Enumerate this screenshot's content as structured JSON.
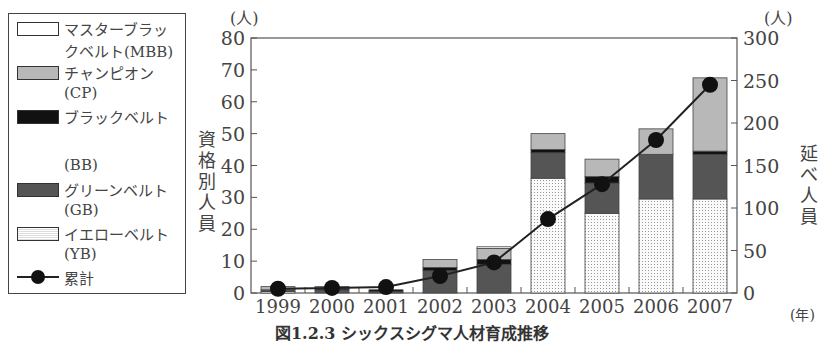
{
  "chart_data": {
    "type": "bar",
    "stacked": true,
    "categories": [
      "1999",
      "2000",
      "2001",
      "2002",
      "2003",
      "2004",
      "2005",
      "2006",
      "2007"
    ],
    "series": [
      {
        "name": "イエローベルト(YB)",
        "key": "YB",
        "axis": "left",
        "values": [
          0.5,
          0,
          0,
          0,
          0,
          36,
          25,
          29.5,
          29.5
        ]
      },
      {
        "name": "グリーンベルト(GB)",
        "key": "GB",
        "axis": "left",
        "values": [
          0.5,
          1,
          0.5,
          7,
          9,
          8,
          9.5,
          14,
          14
        ]
      },
      {
        "name": "ブラックベルト(BB)",
        "key": "BB",
        "axis": "left",
        "values": [
          0,
          0.5,
          0.5,
          1,
          1.5,
          1,
          2,
          0,
          1
        ]
      },
      {
        "name": "チャンピオン(CP)",
        "key": "CP",
        "axis": "left",
        "values": [
          1,
          0.5,
          0,
          2.5,
          3.5,
          5,
          5.5,
          8,
          23
        ]
      },
      {
        "name": "マスターブラックベルト(MBB)",
        "key": "MBB",
        "axis": "left",
        "values": [
          0,
          0,
          0,
          0,
          0.5,
          0,
          0,
          0,
          0
        ]
      },
      {
        "name": "累計",
        "key": "cumulative",
        "type": "line",
        "axis": "right",
        "values": [
          5,
          6,
          7,
          20,
          36,
          87,
          128,
          180,
          245
        ]
      }
    ],
    "title": "図1.2.3 シックスシグマ人材育成推移",
    "xlabel": "(年)",
    "ylabel": "資格別人員",
    "ylabel_unit": "(人)",
    "y2label": "延べ人員",
    "y2label_unit": "(人)",
    "ylim": [
      0,
      80
    ],
    "yticks": [
      0,
      10,
      20,
      30,
      40,
      50,
      60,
      70,
      80
    ],
    "y2lim": [
      0,
      300
    ],
    "y2ticks": [
      0,
      50,
      100,
      150,
      200,
      250,
      300
    ],
    "grid": false,
    "legend_position": "left"
  },
  "legend": {
    "items": [
      {
        "line1": "マスターブラッ",
        "line2": "クベルト(MBB)"
      },
      {
        "line1": "チャンピオン",
        "line2": "(CP)"
      },
      {
        "line1": "ブラックベルト",
        "line2": "(BB)"
      },
      {
        "line1": "グリーンベルト",
        "line2": "(GB)"
      },
      {
        "line1": "イエローベルト",
        "line2": "(YB)"
      },
      {
        "line1": "累計"
      }
    ]
  },
  "axes": {
    "left_unit": "(人)",
    "right_unit": "(人)",
    "x_unit": "(年)",
    "left_title": [
      "資",
      "格",
      "別",
      "人",
      "員"
    ],
    "right_title": [
      "延",
      "べ",
      "人",
      "員"
    ]
  },
  "caption": "図1.2.3 シックスシグマ人材育成推移"
}
